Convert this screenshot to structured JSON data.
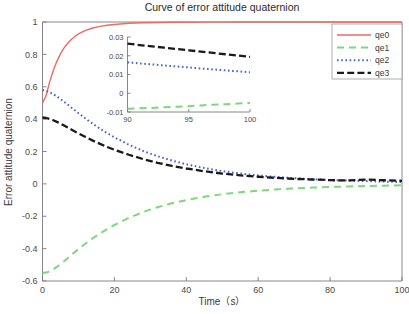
{
  "chart_data": {
    "type": "line",
    "title": "Curve of error attitude quaternion",
    "xlabel": "Time（s）",
    "ylabel": "Error attitude quaternion",
    "xlim": [
      0,
      100
    ],
    "ylim": [
      -0.6,
      1
    ],
    "xticks": [
      0,
      20,
      40,
      60,
      80,
      100
    ],
    "xtick_labels": [
      "0",
      "20",
      "40",
      "60",
      "80",
      "100"
    ],
    "yticks": [
      -0.6,
      -0.4,
      -0.2,
      0,
      0.2,
      0.4,
      0.6,
      0.8,
      1
    ],
    "ytick_labels": [
      "-0.6",
      "-0.4",
      "-0.2",
      "0",
      "0.2",
      "0.4",
      "0.6",
      "0.8",
      "1"
    ],
    "grid": false,
    "legend_position": "top-right",
    "legend": [
      "qe0",
      "qe1",
      "qe2",
      "qe3"
    ],
    "x": [
      0,
      1,
      2,
      3,
      4,
      5,
      6,
      7,
      8,
      9,
      10,
      12,
      14,
      16,
      18,
      20,
      24,
      28,
      32,
      36,
      40,
      45,
      50,
      55,
      60,
      65,
      70,
      75,
      80,
      85,
      90,
      95,
      100
    ],
    "series": [
      {
        "name": "qe0",
        "color": "#ED6A63",
        "style": "solid",
        "values": [
          0.5,
          0.545,
          0.63,
          0.7,
          0.757,
          0.803,
          0.84,
          0.869,
          0.892,
          0.911,
          0.926,
          0.948,
          0.963,
          0.973,
          0.98,
          0.985,
          0.992,
          0.995,
          0.997,
          0.998,
          0.9988,
          0.9993,
          0.9995,
          0.9996,
          0.9997,
          0.9997,
          0.9998,
          0.9998,
          0.9998,
          0.9998,
          0.9998,
          0.9998,
          0.9998
        ]
      },
      {
        "name": "qe1",
        "color": "#7BD97B",
        "style": "dashed",
        "values": [
          -0.55,
          -0.548,
          -0.54,
          -0.528,
          -0.513,
          -0.496,
          -0.478,
          -0.459,
          -0.44,
          -0.421,
          -0.403,
          -0.368,
          -0.336,
          -0.306,
          -0.279,
          -0.254,
          -0.21,
          -0.174,
          -0.144,
          -0.12,
          -0.1,
          -0.08,
          -0.064,
          -0.052,
          -0.042,
          -0.034,
          -0.028,
          -0.023,
          -0.019,
          -0.016,
          -0.013,
          -0.011,
          -0.009
        ]
      },
      {
        "name": "qe2",
        "color": "#4A63C8",
        "style": "dotted",
        "values": [
          0.58,
          0.575,
          0.566,
          0.554,
          0.54,
          0.524,
          0.507,
          0.49,
          0.472,
          0.455,
          0.437,
          0.403,
          0.371,
          0.341,
          0.313,
          0.288,
          0.242,
          0.203,
          0.171,
          0.144,
          0.121,
          0.098,
          0.079,
          0.064,
          0.052,
          0.043,
          0.035,
          0.029,
          0.024,
          0.02,
          0.017,
          0.014,
          0.011
        ]
      },
      {
        "name": "qe3",
        "color": "#1A1A1A",
        "style": "dashdot",
        "values": [
          0.41,
          0.407,
          0.401,
          0.393,
          0.383,
          0.372,
          0.36,
          0.348,
          0.336,
          0.324,
          0.312,
          0.289,
          0.267,
          0.247,
          0.228,
          0.211,
          0.18,
          0.153,
          0.13,
          0.111,
          0.095,
          0.078,
          0.064,
          0.053,
          0.044,
          0.037,
          0.031,
          0.027,
          0.023,
          0.021,
          0.0265,
          0.0225,
          0.019
        ]
      }
    ],
    "inset": {
      "xlim": [
        90,
        100
      ],
      "ylim": [
        -0.01,
        0.03
      ],
      "xticks": [
        90,
        95,
        100
      ],
      "xtick_labels": [
        "90",
        "95",
        "100"
      ],
      "yticks": [
        -0.01,
        0,
        0.01,
        0.02,
        0.03
      ],
      "ytick_labels": [
        "-0.01",
        "0",
        "0.01",
        "0.02",
        "0.03"
      ],
      "x": [
        90,
        91,
        92,
        93,
        94,
        95,
        96,
        97,
        98,
        99,
        100
      ],
      "series": [
        {
          "name": "qe1",
          "color": "#7BD97B",
          "style": "dashed",
          "values": [
            -0.0082,
            -0.008,
            -0.0078,
            -0.0075,
            -0.0072,
            -0.0069,
            -0.0065,
            -0.0061,
            -0.0058,
            -0.0055,
            -0.0052
          ]
        },
        {
          "name": "qe2",
          "color": "#4A63C8",
          "style": "dotted",
          "values": [
            0.0165,
            0.0159,
            0.0154,
            0.0148,
            0.0143,
            0.0138,
            0.0132,
            0.0127,
            0.0122,
            0.0117,
            0.0112
          ]
        },
        {
          "name": "qe3",
          "color": "#1A1A1A",
          "style": "dashdot",
          "values": [
            0.0265,
            0.0257,
            0.025,
            0.0243,
            0.0236,
            0.0229,
            0.0222,
            0.0215,
            0.0208,
            0.0201,
            0.0194
          ]
        }
      ]
    }
  }
}
